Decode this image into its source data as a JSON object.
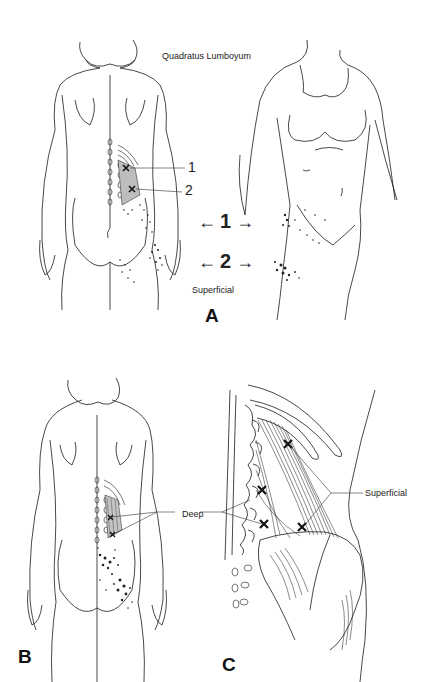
{
  "figure": {
    "title": "Quadratus Lumboyum",
    "panels": [
      {
        "id": "A",
        "letter": "A",
        "views": [
          "posterior",
          "anterior-lateral"
        ],
        "trigger_point_labels": [
          "1",
          "2"
        ],
        "referral_markers": [
          {
            "label": "1",
            "arrow_left": "←",
            "arrow_right": "→"
          },
          {
            "label": "2",
            "arrow_left": "←",
            "arrow_right": "→"
          }
        ],
        "layer_label": "Superficial"
      },
      {
        "id": "B",
        "letter": "B",
        "views": [
          "posterior"
        ],
        "layer_label": "Deep"
      },
      {
        "id": "C",
        "letter": "C",
        "views": [
          "anatomical detail"
        ],
        "layer_label": "Superficial"
      }
    ],
    "colors": {
      "line": "#1a1a1a",
      "stipple": "#222222",
      "background": "#ffffff"
    }
  }
}
